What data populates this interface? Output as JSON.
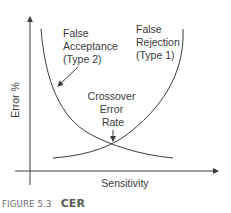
{
  "diagram": {
    "title": "CER",
    "axes": {
      "y_label": "Error %",
      "x_label": "Sensitivity"
    },
    "curves": [
      {
        "id": "false-acceptance",
        "label_lines": [
          "False",
          "Acceptance",
          "(Type 2)"
        ],
        "trend": "decreasing"
      },
      {
        "id": "false-rejection",
        "label_lines": [
          "False",
          "Rejection",
          "(Type 1)"
        ],
        "trend": "increasing"
      }
    ],
    "annotation": {
      "label_lines": [
        "Crossover",
        "Error",
        "Rate"
      ]
    },
    "colors": {
      "line": "#3c3c3c",
      "text": "#3a3a3a",
      "caption": "#666666"
    }
  },
  "caption": {
    "figure_number": "FIGURE 5.3",
    "figure_title": "CER"
  }
}
